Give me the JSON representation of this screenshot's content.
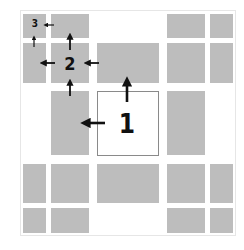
{
  "diagram": {
    "colors": {
      "block": "#bdbdbd",
      "background": "#ffffff",
      "arrow": "#111111",
      "center_border": "#8a8a8a"
    },
    "labels": {
      "level1": "1",
      "level2": "2",
      "level3": "3"
    }
  }
}
